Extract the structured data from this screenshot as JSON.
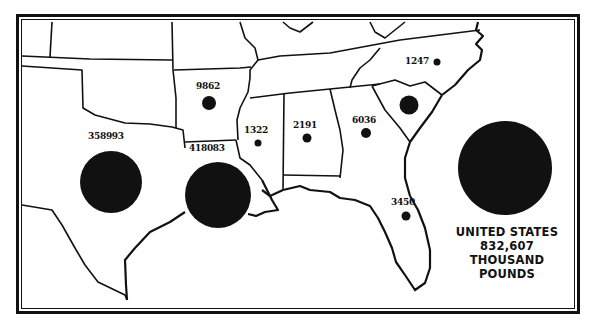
{
  "map": {
    "title": "",
    "unit": "thousand pounds",
    "region": "Southern United States",
    "states": [
      {
        "name": "Texas",
        "value": "358993",
        "circle_size": "large"
      },
      {
        "name": "Louisiana",
        "value": "418083",
        "circle_size": "large"
      },
      {
        "name": "Arkansas",
        "value": "9862",
        "circle_size": "small"
      },
      {
        "name": "Mississippi",
        "value": "1322",
        "circle_size": "tiny"
      },
      {
        "name": "Alabama",
        "value": "2191",
        "circle_size": "tiny"
      },
      {
        "name": "Georgia",
        "value": "6036",
        "circle_size": "tiny"
      },
      {
        "name": "North Carolina",
        "value": "1247",
        "circle_size": "tiny"
      },
      {
        "name": "South Carolina",
        "value": "",
        "circle_size": "small"
      },
      {
        "name": "Florida",
        "value": "3450",
        "circle_size": "tiny"
      }
    ],
    "legend": {
      "line1": "UNITED STATES",
      "line2": "832,607",
      "line3": "THOUSAND",
      "line4": "POUNDS"
    },
    "colors": {
      "ink": "#111111",
      "background": "#ffffff"
    }
  }
}
